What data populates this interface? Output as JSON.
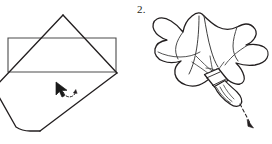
{
  "figure": {
    "background_color": "#ffffff",
    "ink_color": "#231f20",
    "panel_count": 2
  },
  "panels": [
    {
      "id": "panel-left",
      "step_label": "",
      "caption": "",
      "description": "Flat square napkin laid as a diamond over a rectangular place mat, with mouse cursor and rotation arc",
      "shapes": [
        {
          "name": "place-mat-rectangle",
          "type": "rectangle"
        },
        {
          "name": "napkin-diamond",
          "type": "rotated-square"
        }
      ],
      "cursor": {
        "name": "mouse-cursor",
        "x": 58,
        "y": 84
      },
      "rotation_marker": {
        "name": "rotation-arc-arrow",
        "x": 69,
        "y": 95
      }
    },
    {
      "id": "panel-right",
      "step_label": "2.",
      "caption": "",
      "description": "Gathered cloth drawn through a napkin ring with a dashed pull arrow",
      "shapes": [
        {
          "name": "gathered-cloth",
          "type": "freeform"
        },
        {
          "name": "napkin-ring",
          "type": "band"
        },
        {
          "name": "cloth-tail",
          "type": "freeform"
        }
      ],
      "pull_arrow": {
        "name": "dashed-pull-arrow",
        "style": "dashed",
        "direction": "down-right"
      }
    }
  ],
  "colors": {
    "ink": "#231f20",
    "outline": "#3a3a3a",
    "fold_line": "#5a5a5a",
    "paper": "#ffffff",
    "cursor_fill": "#1a1a1a"
  }
}
